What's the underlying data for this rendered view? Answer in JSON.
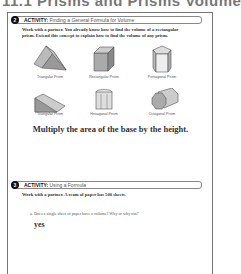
{
  "page": {
    "title": "11.1 Prisms and Prisms Volume"
  },
  "activity2": {
    "number": "2",
    "keyword": "ACTIVITY:",
    "heading": "Finding a General Formula for Volume",
    "instructions_line1": "Work with a partner. You already know how to find the volume of a rectangular",
    "instructions_line2": "prism. Extend this concept to explain how to find the volume of any prism.",
    "prisms": [
      {
        "label": "Triangular Prism",
        "icon": "triangular-prism-icon"
      },
      {
        "label": "Rectangular Prism",
        "icon": "rectangular-prism-icon"
      },
      {
        "label": "Pentagonal Prism",
        "icon": "pentagonal-prism-icon"
      },
      {
        "label": "Triangular Prism",
        "icon": "triangular-prism-icon"
      },
      {
        "label": "Hexagonal Prism",
        "icon": "hexagonal-prism-icon"
      },
      {
        "label": "Octagonal Prism",
        "icon": "octagonal-prism-icon"
      }
    ],
    "answer": "Multiply the area of the base by the height."
  },
  "activity3": {
    "number": "3",
    "keyword": "ACTIVITY:",
    "heading": "Using a Formula",
    "instructions": "Work with a partner. A ream of paper has 500 sheets.",
    "question_bullet": "a.",
    "question": "Does a single sheet of paper have a volume? Why or why not?",
    "answer": "yes"
  }
}
